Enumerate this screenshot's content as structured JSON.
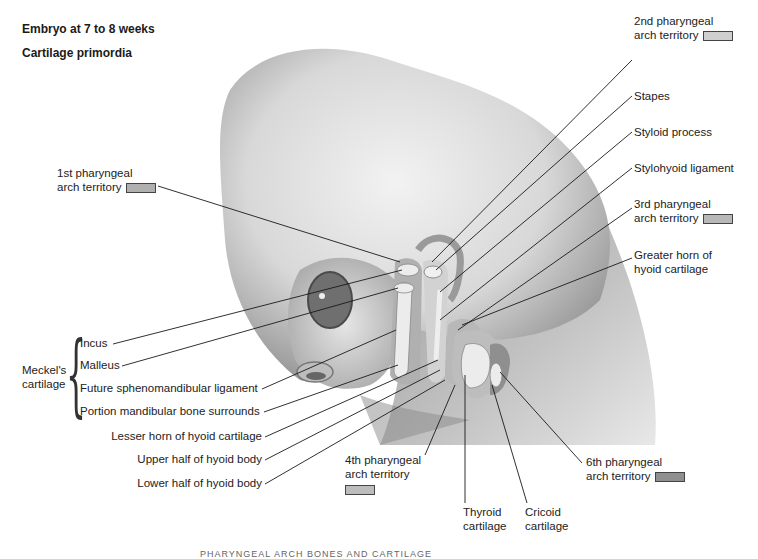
{
  "header": {
    "title": "Embryo at 7 to 8 weeks",
    "subtitle": "Cartilage primordia"
  },
  "colors": {
    "arch1": "#b0b0b0",
    "arch2": "#cfcfcf",
    "arch3": "#b8b8b8",
    "arch4": "#bdbdbd",
    "arch6": "#8f8f8f",
    "cartilage": "#e6e6e6",
    "line": "#1a1a1a"
  },
  "labels_right": {
    "arch2_line1": "2nd pharyngeal",
    "arch2_line2": "arch territory",
    "stapes": "Stapes",
    "styloid": "Styloid process",
    "stylohyoid": "Stylohyoid ligament",
    "arch3_line1": "3rd pharyngeal",
    "arch3_line2": "arch territory",
    "greater_horn_line1": "Greater horn of",
    "greater_horn_line2": "hyoid cartilage",
    "arch6_line1": "6th pharyngeal",
    "arch6_line2": "arch territory"
  },
  "labels_left": {
    "arch1_line1": "1st pharyngeal",
    "arch1_line2": "arch territory",
    "meckel_line1": "Meckel's",
    "meckel_line2": "cartilage",
    "incus": "Incus",
    "malleus": "Malleus",
    "sphenomandibular": "Future sphenomandibular ligament",
    "mandibular": "Portion mandibular bone surrounds",
    "lesser_horn": "Lesser horn of hyoid cartilage",
    "upper_hyoid": "Upper half of hyoid body",
    "lower_hyoid": "Lower half of hyoid body"
  },
  "labels_bottom": {
    "arch4_line1": "4th pharyngeal",
    "arch4_line2": "arch territory",
    "thyroid_line1": "Thyroid",
    "thyroid_line2": "cartilage",
    "cricoid_line1": "Cricoid",
    "cricoid_line2": "cartilage"
  },
  "caption": "PHARYNGEAL ARCH BONES AND CARTILAGE"
}
